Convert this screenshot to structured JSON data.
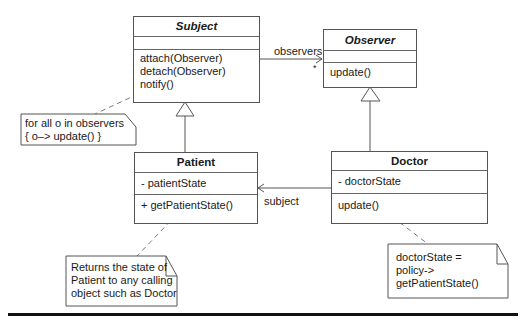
{
  "diagram": {
    "type": "UML class diagram",
    "classes": {
      "subject": {
        "name": "Subject",
        "abstract": true,
        "attributes": [],
        "operations": [
          "attach(Observer)",
          "detach(Observer)",
          "notify()"
        ]
      },
      "observer": {
        "name": "Observer",
        "abstract": true,
        "attributes": [],
        "operations": [
          "update()"
        ]
      },
      "patient": {
        "name": "Patient",
        "abstract": false,
        "attributes": [
          "- patientState"
        ],
        "operations": [
          "+ getPatientState()"
        ]
      },
      "doctor": {
        "name": "Doctor",
        "abstract": false,
        "attributes": [
          "- doctorState"
        ],
        "operations": [
          "update()"
        ]
      }
    },
    "relationships": [
      {
        "type": "association",
        "from": "Subject",
        "to": "Observer",
        "role": "observers",
        "multiplicity": "*"
      },
      {
        "type": "generalization",
        "from": "Patient",
        "to": "Subject"
      },
      {
        "type": "generalization",
        "from": "Doctor",
        "to": "Observer"
      },
      {
        "type": "association",
        "from": "Doctor",
        "to": "Patient",
        "role": "subject"
      }
    ],
    "association_labels": {
      "observers": "observers",
      "multiplicity": "*",
      "subject": "subject"
    },
    "notes": {
      "notify_note": [
        "for all o in observers",
        "{ o–> update() }"
      ],
      "patient_note": [
        "Returns the state of",
        "Patient to any calling",
        "object such as Doctor"
      ],
      "doctor_note": [
        "doctorState =",
        "policy->",
        "getPatientState()"
      ]
    },
    "colors": {
      "line": "#555555",
      "text": "#1a1a1a",
      "background": "#ffffff",
      "rule": "#111111"
    }
  }
}
